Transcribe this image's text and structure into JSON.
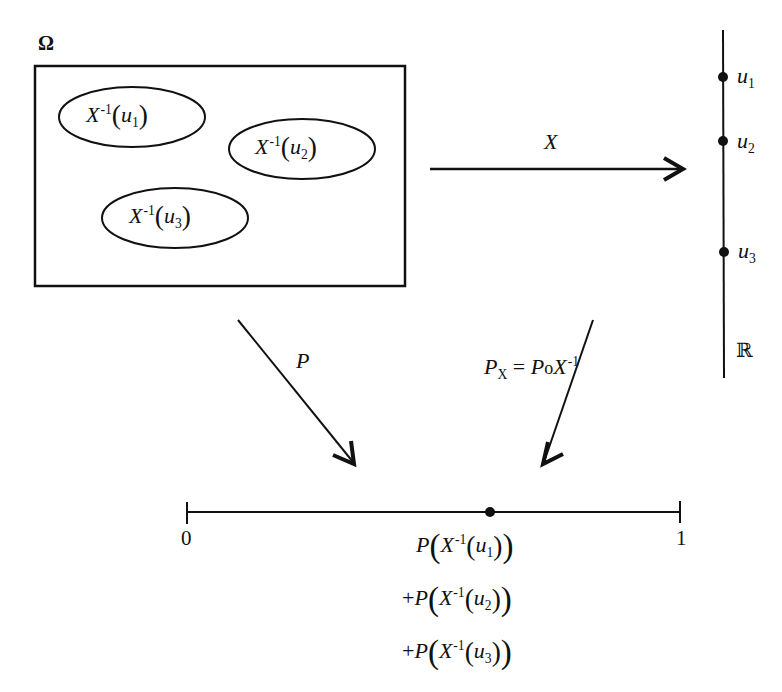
{
  "diagram": {
    "sample_space": {
      "label": "Ω",
      "preimages": [
        {
          "fn": "X",
          "exp": "-1",
          "var": "u",
          "sub": "1"
        },
        {
          "fn": "X",
          "exp": "-1",
          "var": "u",
          "sub": "2"
        },
        {
          "fn": "X",
          "exp": "-1",
          "var": "u",
          "sub": "3"
        }
      ]
    },
    "real_line": {
      "label": "ℝ",
      "points": [
        {
          "var": "u",
          "sub": "1"
        },
        {
          "var": "u",
          "sub": "2"
        },
        {
          "var": "u",
          "sub": "3"
        }
      ]
    },
    "arrows": {
      "x_map": {
        "label": "X"
      },
      "p_map": {
        "label": "P"
      },
      "px_map": {
        "lhs": "P",
        "lhs_sub": "X",
        "eq": "=",
        "rhs_p": "P",
        "compose": "o",
        "rhs_x": "X",
        "rhs_exp": "-1"
      }
    },
    "unit_interval": {
      "start_label": "0",
      "end_label": "1",
      "sum_terms": [
        {
          "prefix": "",
          "p": "P",
          "fn": "X",
          "exp": "-1",
          "var": "u",
          "sub": "1"
        },
        {
          "prefix": "+",
          "p": "P",
          "fn": "X",
          "exp": "-1",
          "var": "u",
          "sub": "2"
        },
        {
          "prefix": "+",
          "p": "P",
          "fn": "X",
          "exp": "-1",
          "var": "u",
          "sub": "3"
        }
      ]
    }
  }
}
